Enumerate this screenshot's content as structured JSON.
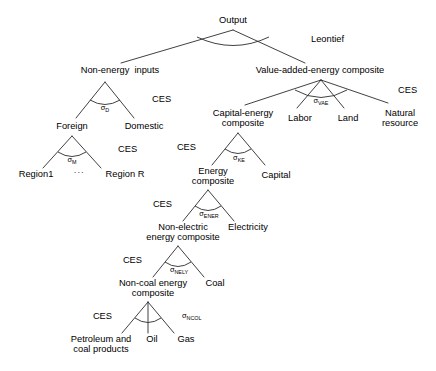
{
  "diagram": {
    "type": "tree",
    "line_color": "#2b2b2b",
    "text_color": "#000000",
    "background": "#ffffff",
    "nodes": {
      "output": "Output",
      "non_energy_inputs": "Non-energy  inputs",
      "vae_composite": "Value-added-energy composite",
      "foreign": "Foreign",
      "domestic": "Domestic",
      "region1": "Region1",
      "region_ellipsis": "···",
      "region_r": "Region R",
      "capital_energy_l1": "Capital-energy",
      "capital_energy_l2": "composite",
      "labor": "Labor",
      "land": "Land",
      "natural_l1": "Natural",
      "natural_l2": "resource",
      "energy_l1": "Energy",
      "energy_l2": "composite",
      "capital": "Capital",
      "non_electric_l1": "Non-electric",
      "non_electric_l2": "energy composite",
      "electricity": "Electricity",
      "non_coal_l1": "Non-coal energy",
      "non_coal_l2": "composite",
      "coal": "Coal",
      "petroleum_l1": "Petroleum and",
      "petroleum_l2": "coal products",
      "oil": "Oil",
      "gas": "Gas"
    },
    "functions": {
      "leontief": "Leontief",
      "ces_d": "CES",
      "ces_m": "CES",
      "ces_vae": "CES",
      "ces_ke": "CES",
      "ces_ener": "CES",
      "ces_nely": "CES",
      "ces_ncol": "CES"
    },
    "elasticities": {
      "sigma": "σ",
      "sub_d": "D",
      "sub_m": "M",
      "sub_vae": "VAE",
      "sub_ke": "KE",
      "sub_ener": "ENER",
      "sub_nely": "NELY",
      "sub_ncol": "NCOL"
    }
  }
}
